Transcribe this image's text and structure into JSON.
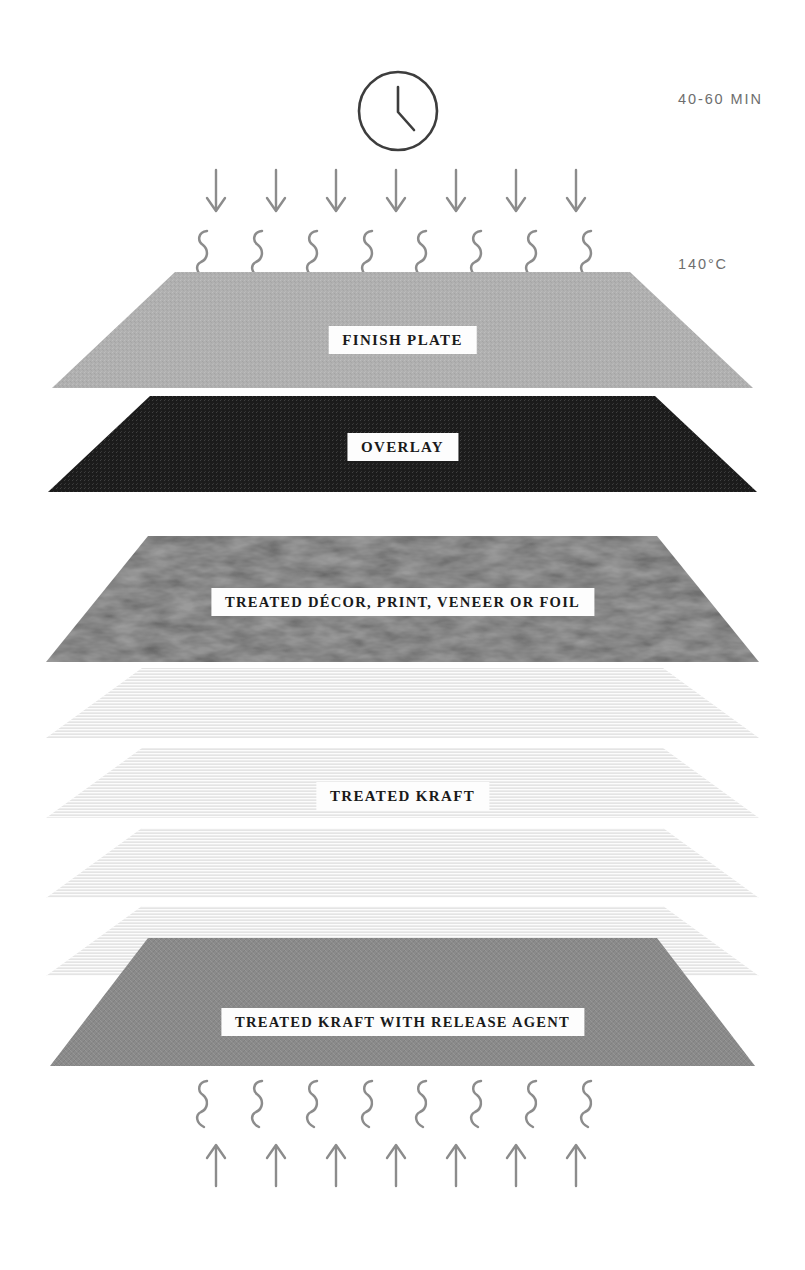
{
  "diagram": {
    "process_icon": "clock-icon",
    "annotations": {
      "time": "40-60 MIN",
      "temperature": "140°C"
    },
    "heat_indicators": {
      "top_arrow_count": 7,
      "top_squiggle_count": 8,
      "bottom_squiggle_count": 8,
      "bottom_arrow_count": 7,
      "arrow_color": "#8c8c8c",
      "squiggle_color": "#8c8c8c",
      "top_arrow_direction": "down",
      "bottom_arrow_direction": "up"
    },
    "layers": [
      {
        "id": "finish-plate",
        "label": "FINISH PLATE",
        "color": "#b0b0b0",
        "texture": "fine-noise",
        "top_y": 272,
        "bottom_y": 388,
        "top_inset": 175,
        "bottom_inset": 52,
        "caption_y": 326,
        "caption_wide": false
      },
      {
        "id": "overlay",
        "label": "OVERLAY",
        "color": "#1c1c1c",
        "texture": "fine-noise",
        "top_y": 396,
        "bottom_y": 492,
        "top_inset": 150,
        "bottom_inset": 48,
        "caption_y": 433,
        "caption_wide": false
      },
      {
        "id": "treated-decor",
        "label": "TREATED DÉCOR, PRINT, VENEER OR FOIL",
        "color": "#3a3a3a",
        "texture": "organic-grain",
        "top_y": 536,
        "bottom_y": 662,
        "top_inset": 148,
        "bottom_inset": 46,
        "caption_y": 588,
        "caption_wide": true
      },
      {
        "id": "treated-kraft-1",
        "label": "",
        "color": "#ececec",
        "texture": "horizontal-lines",
        "top_y": 668,
        "bottom_y": 738,
        "top_inset": 142,
        "bottom_inset": 46,
        "caption_y": null,
        "caption_wide": false
      },
      {
        "id": "treated-kraft-2",
        "label": "",
        "color": "#ececec",
        "texture": "horizontal-lines",
        "top_y": 748,
        "bottom_y": 818,
        "top_inset": 142,
        "bottom_inset": 46,
        "caption_y": null,
        "caption_wide": false
      },
      {
        "id": "treated-kraft-3",
        "label": "TREATED KRAFT",
        "color": "#ececec",
        "texture": "horizontal-lines",
        "top_y": 828,
        "bottom_y": 898,
        "top_inset": 142,
        "bottom_inset": 46,
        "caption_y": 782,
        "caption_wide": false
      },
      {
        "id": "treated-kraft-4",
        "label": "",
        "color": "#ececec",
        "texture": "horizontal-lines",
        "top_y": 906,
        "bottom_y": 976,
        "top_inset": 142,
        "bottom_inset": 46,
        "caption_y": null,
        "caption_wide": false
      },
      {
        "id": "treated-kraft-release-agent",
        "label": "TREATED KRAFT WITH RELEASE AGENT",
        "color": "#8a8a8a",
        "texture": "weave",
        "top_y": 938,
        "bottom_y": 1066,
        "top_inset": 148,
        "bottom_inset": 50,
        "caption_y": 1008,
        "caption_wide": true
      }
    ]
  }
}
